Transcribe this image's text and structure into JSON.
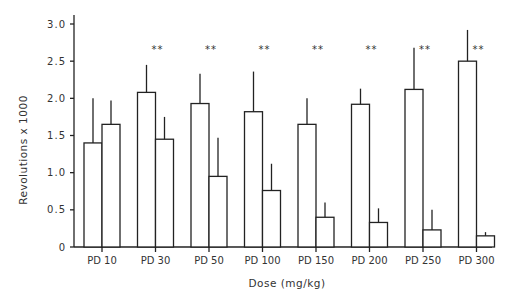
{
  "chart_data": {
    "type": "bar",
    "title": "",
    "xlabel": "Dose (mg/kg)",
    "ylabel": "Revolutions x 1000",
    "ylim": [
      0,
      3.0
    ],
    "yticks": [
      "0",
      "0.5",
      "1.0",
      "1.5",
      "2.0",
      "2.5",
      "3.0"
    ],
    "ytick_values": [
      0,
      0.5,
      1.0,
      1.5,
      2.0,
      2.5,
      3.0
    ],
    "grid": false,
    "legend": null,
    "categories": [
      "PD 10",
      "PD 30",
      "PD 50",
      "PD 100",
      "PD 150",
      "PD 200",
      "PD 250",
      "PD 300"
    ],
    "series": [
      {
        "name": "left bar",
        "values": [
          1.4,
          2.08,
          1.93,
          1.82,
          1.65,
          1.92,
          2.12,
          2.5
        ],
        "error_upper": [
          2.0,
          2.45,
          2.33,
          2.36,
          2.0,
          2.13,
          2.68,
          2.92
        ]
      },
      {
        "name": "right bar",
        "values": [
          1.65,
          1.45,
          0.95,
          0.76,
          0.4,
          0.33,
          0.23,
          0.15
        ],
        "error_upper": [
          1.97,
          1.75,
          1.47,
          1.12,
          0.6,
          0.52,
          0.5,
          0.2
        ]
      }
    ],
    "annotations": [
      "",
      "**",
      "**",
      "**",
      "**",
      "**",
      "**",
      "**"
    ]
  }
}
